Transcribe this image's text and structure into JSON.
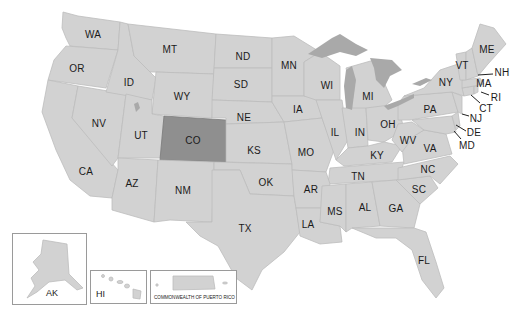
{
  "map": {
    "title": "United States",
    "highlighted_state": "CO",
    "colors": {
      "state_fill": "#d2d2d2",
      "state_border": "#bcbcbc",
      "highlight_fill": "#8f8f8f",
      "lake_fill": "#a9a9a9",
      "background": "#ffffff"
    },
    "states": [
      {
        "abbr": "WA",
        "x": 93,
        "y": 34
      },
      {
        "abbr": "OR",
        "x": 77,
        "y": 68
      },
      {
        "abbr": "ID",
        "x": 129,
        "y": 82
      },
      {
        "abbr": "MT",
        "x": 170,
        "y": 49
      },
      {
        "abbr": "ND",
        "x": 243,
        "y": 56
      },
      {
        "abbr": "SD",
        "x": 241,
        "y": 84
      },
      {
        "abbr": "WY",
        "x": 182,
        "y": 96
      },
      {
        "abbr": "NV",
        "x": 99,
        "y": 123
      },
      {
        "abbr": "UT",
        "x": 141,
        "y": 135
      },
      {
        "abbr": "CO",
        "x": 193,
        "y": 140
      },
      {
        "abbr": "NE",
        "x": 244,
        "y": 117
      },
      {
        "abbr": "KS",
        "x": 254,
        "y": 150
      },
      {
        "abbr": "CA",
        "x": 86,
        "y": 171
      },
      {
        "abbr": "AZ",
        "x": 132,
        "y": 183
      },
      {
        "abbr": "NM",
        "x": 183,
        "y": 190
      },
      {
        "abbr": "OK",
        "x": 266,
        "y": 182
      },
      {
        "abbr": "TX",
        "x": 245,
        "y": 228
      },
      {
        "abbr": "MN",
        "x": 289,
        "y": 65
      },
      {
        "abbr": "WI",
        "x": 327,
        "y": 85
      },
      {
        "abbr": "MI",
        "x": 368,
        "y": 96
      },
      {
        "abbr": "IA",
        "x": 298,
        "y": 109
      },
      {
        "abbr": "IL",
        "x": 335,
        "y": 132
      },
      {
        "abbr": "IN",
        "x": 360,
        "y": 132
      },
      {
        "abbr": "OH",
        "x": 388,
        "y": 124
      },
      {
        "abbr": "MO",
        "x": 306,
        "y": 152
      },
      {
        "abbr": "KY",
        "x": 377,
        "y": 155
      },
      {
        "abbr": "WV",
        "x": 408,
        "y": 140
      },
      {
        "abbr": "VA",
        "x": 430,
        "y": 148
      },
      {
        "abbr": "PA",
        "x": 430,
        "y": 109
      },
      {
        "abbr": "NY",
        "x": 446,
        "y": 82
      },
      {
        "abbr": "VT",
        "x": 462,
        "y": 65
      },
      {
        "abbr": "ME",
        "x": 487,
        "y": 49
      },
      {
        "abbr": "TN",
        "x": 358,
        "y": 176
      },
      {
        "abbr": "NC",
        "x": 428,
        "y": 169
      },
      {
        "abbr": "SC",
        "x": 419,
        "y": 189
      },
      {
        "abbr": "AR",
        "x": 311,
        "y": 189
      },
      {
        "abbr": "MS",
        "x": 335,
        "y": 211
      },
      {
        "abbr": "AL",
        "x": 365,
        "y": 207
      },
      {
        "abbr": "GA",
        "x": 396,
        "y": 208
      },
      {
        "abbr": "LA",
        "x": 308,
        "y": 224
      },
      {
        "abbr": "FL",
        "x": 424,
        "y": 260
      }
    ],
    "callouts": [
      {
        "abbr": "NH",
        "x": 502,
        "y": 72
      },
      {
        "abbr": "MA",
        "x": 484,
        "y": 83
      },
      {
        "abbr": "RI",
        "x": 496,
        "y": 97
      },
      {
        "abbr": "CT",
        "x": 486,
        "y": 108
      },
      {
        "abbr": "NJ",
        "x": 476,
        "y": 118
      },
      {
        "abbr": "DE",
        "x": 474,
        "y": 132
      },
      {
        "abbr": "MD",
        "x": 467,
        "y": 145
      }
    ],
    "insets": [
      {
        "abbr": "AK",
        "label": "AK"
      },
      {
        "abbr": "HI",
        "label": "HI"
      },
      {
        "abbr": "PR",
        "label": "COMMONWEALTH OF PUERTO RICO"
      }
    ]
  }
}
